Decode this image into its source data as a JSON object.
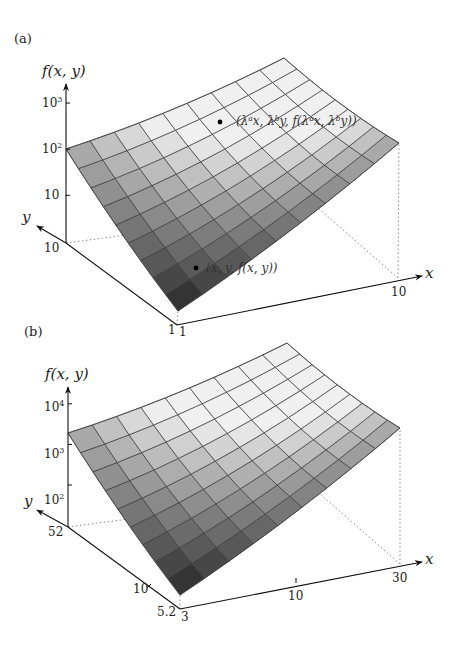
{
  "figure": {
    "panels": [
      {
        "id": "a",
        "label": "(a)",
        "z_axis_title": "f(x, y)",
        "y_axis_title": "y",
        "x_axis_title": "x",
        "z_ticks": [
          {
            "base": "10",
            "exp": "3"
          },
          {
            "base": "10",
            "exp": "2"
          },
          {
            "base": "10",
            "exp": ""
          }
        ],
        "y_ticks": [
          "10",
          "1"
        ],
        "x_ticks": [
          "1",
          "10"
        ],
        "annotations": [
          {
            "text": "(λᵃx, λᵇy, f(λᵃx, λᵇy))",
            "kind": "scaled-point"
          },
          {
            "text": "(x, y, f(x, y))",
            "kind": "point"
          }
        ]
      },
      {
        "id": "b",
        "label": "(b)",
        "z_axis_title": "f(x, y)",
        "y_axis_title": "y",
        "x_axis_title": "x",
        "z_ticks": [
          {
            "base": "10",
            "exp": "4"
          },
          {
            "base": "10",
            "exp": "3"
          },
          {
            "base": "10",
            "exp": "2"
          }
        ],
        "y_ticks": [
          "52",
          "10",
          "5.2"
        ],
        "x_ticks": [
          "3",
          "10",
          "30"
        ],
        "annotations": []
      }
    ]
  },
  "chart_data": [
    {
      "type": "surface",
      "title": "(a)",
      "xlabel": "x",
      "ylabel": "y",
      "zlabel": "f(x, y)",
      "x_scale": "log",
      "y_scale": "log",
      "z_scale": "log",
      "x_range": [
        1,
        10
      ],
      "y_range": [
        1,
        10
      ],
      "z_ticks": [
        10,
        100,
        1000
      ],
      "grid": "9x9 mesh",
      "points": [
        {
          "label": "(x, y, f(x, y))"
        },
        {
          "label": "(λ^a x, λ^b y, f(λ^a x, λ^b y))"
        }
      ]
    },
    {
      "type": "surface",
      "title": "(b)",
      "xlabel": "x",
      "ylabel": "y",
      "zlabel": "f(x, y)",
      "x_scale": "log",
      "y_scale": "log",
      "z_scale": "log",
      "x_range": [
        3,
        30
      ],
      "y_range": [
        5.2,
        52
      ],
      "x_ticks": [
        3,
        10,
        30
      ],
      "y_ticks": [
        5.2,
        10,
        52
      ],
      "z_ticks": [
        100,
        1000,
        10000
      ],
      "grid": "9x9 mesh"
    }
  ],
  "geometry": {
    "a": {
      "L": [
        66,
        149
      ],
      "T": [
        284,
        58
      ],
      "R": [
        399,
        143
      ],
      "B": [
        178,
        311
      ],
      "O": [
        177,
        325
      ],
      "Yend": [
        66,
        243
      ],
      "Yarrow": [
        37,
        226
      ],
      "Xend": [
        398,
        278
      ],
      "Xarrow": [
        422,
        276
      ],
      "Ztop": [
        66,
        84
      ],
      "dot1": [
        196,
        268
      ],
      "dot2": [
        220,
        122
      ]
    },
    "b": {
      "L": [
        68,
        433
      ],
      "T": [
        287,
        343
      ],
      "R": [
        400,
        428
      ],
      "B": [
        180,
        595
      ],
      "O": [
        180,
        609
      ],
      "Yend": [
        68,
        527
      ],
      "Yarrow": [
        37,
        510
      ],
      "Xend": [
        400,
        564
      ],
      "Xarrow": [
        422,
        562
      ],
      "Ztop": [
        68,
        387
      ]
    }
  }
}
